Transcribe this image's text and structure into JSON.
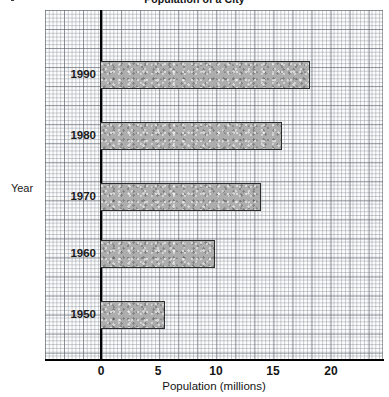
{
  "chart_data": {
    "type": "bar",
    "orientation": "horizontal",
    "title": "Population of a City",
    "xlabel": "Population (millions)",
    "ylabel": "Year",
    "categories": [
      "1990",
      "1980",
      "1970",
      "1960",
      "1950"
    ],
    "values": [
      18.3,
      15.8,
      14.0,
      10.0,
      5.6
    ],
    "series": [
      {
        "name": "Population",
        "values": [
          18.3,
          15.8,
          14.0,
          10.0,
          5.6
        ]
      }
    ],
    "xlim": [
      -4.8,
      24.6
    ],
    "x_ticks": [
      0,
      5,
      10,
      15,
      20
    ],
    "x_tick_labels": [
      "0",
      "5",
      "10",
      "15",
      "20"
    ],
    "y_tick_labels": [
      "1990",
      "1980",
      "1970",
      "1960",
      "1950"
    ],
    "grid": true,
    "grid_style": "graph-paper",
    "legend": false,
    "bar_fill_color": "#adadad",
    "bar_border_color": "#2b2b2b",
    "axis_color": "#000000",
    "grid_color": "#7d8491",
    "background_color": "#fdfdfd"
  },
  "bars": [
    {
      "label": "1990",
      "value": 18.3,
      "left_px": 100,
      "top_px": 61,
      "width_px": 210,
      "height_px": 28
    },
    {
      "label": "1980",
      "value": 15.8,
      "left_px": 100,
      "top_px": 122,
      "width_px": 182,
      "height_px": 28
    },
    {
      "label": "1970",
      "value": 14.0,
      "left_px": 100,
      "top_px": 183,
      "width_px": 161,
      "height_px": 28
    },
    {
      "label": "1960",
      "value": 10.0,
      "left_px": 100,
      "top_px": 240,
      "width_px": 115,
      "height_px": 28
    },
    {
      "label": "1950",
      "value": 5.6,
      "left_px": 100,
      "top_px": 301,
      "width_px": 65,
      "height_px": 28
    }
  ],
  "y_tick_labels": [
    {
      "text": "1990",
      "top_px": 68
    },
    {
      "text": "1980",
      "top_px": 129
    },
    {
      "text": "1970",
      "top_px": 190
    },
    {
      "text": "1960",
      "top_px": 247
    },
    {
      "text": "1950",
      "top_px": 308
    }
  ],
  "x_tick_labels": [
    {
      "text": "0",
      "left_px": 81
    },
    {
      "text": "5",
      "left_px": 138
    },
    {
      "text": "10",
      "left_px": 196
    },
    {
      "text": "15",
      "left_px": 253
    },
    {
      "text": "20",
      "left_px": 311
    }
  ]
}
